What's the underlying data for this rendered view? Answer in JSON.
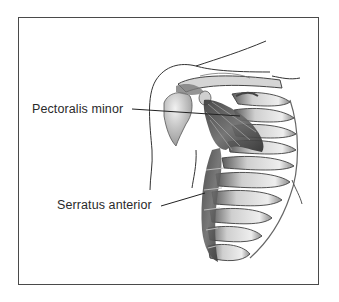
{
  "figure": {
    "type": "anatomical-illustration",
    "style": "grayscale pencil shading, framed"
  },
  "labels": [
    {
      "text": "Pectoralis minor",
      "leader_target": "pectoralis-minor-muscle"
    },
    {
      "text": "Serratus anterior",
      "leader_target": "serratus-anterior-muscle"
    }
  ],
  "colors": {
    "frame": "#4a4a4a",
    "ink": "#2a2a2a",
    "shade_dark": "#555555",
    "shade_mid": "#9a9a9a",
    "shade_light": "#d8d8d8"
  }
}
